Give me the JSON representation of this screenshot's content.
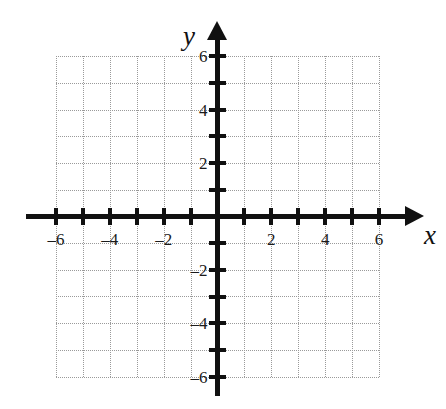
{
  "chart_data": {
    "type": "scatter",
    "title": "",
    "subtitle": "",
    "xlabel": "x",
    "ylabel": "y",
    "xlim": [
      -6,
      6
    ],
    "ylim": [
      -6,
      6
    ],
    "grid": true,
    "grid_step": 1,
    "tick_step": 1,
    "legend": null,
    "series": [],
    "x_tick_values": [
      -6,
      -5,
      -4,
      -3,
      -2,
      -1,
      1,
      2,
      3,
      4,
      5,
      6
    ],
    "y_tick_values": [
      6,
      5,
      4,
      3,
      2,
      1,
      -1,
      -2,
      -3,
      -4,
      -5,
      -6
    ],
    "x_labeled_ticks": [
      {
        "value": -6,
        "label": "–6"
      },
      {
        "value": -4,
        "label": "–4"
      },
      {
        "value": -2,
        "label": "–2"
      },
      {
        "value": 2,
        "label": "2"
      },
      {
        "value": 4,
        "label": "4"
      },
      {
        "value": 6,
        "label": "6"
      }
    ],
    "y_labeled_ticks": [
      {
        "value": 6,
        "label": "6"
      },
      {
        "value": 4,
        "label": "4"
      },
      {
        "value": 2,
        "label": "2"
      },
      {
        "value": -2,
        "label": "–2"
      },
      {
        "value": -4,
        "label": "–4"
      },
      {
        "value": -6,
        "label": "–6"
      }
    ],
    "annotations": [],
    "colors": {
      "axis": "#111111",
      "grid": "#9a9a9a",
      "label": "#1a1a1a",
      "background": "#ffffff"
    }
  },
  "axes": {
    "x_name": "x",
    "y_name": "y",
    "x_arrow": "arrow-right",
    "y_arrow": "arrow-up"
  }
}
